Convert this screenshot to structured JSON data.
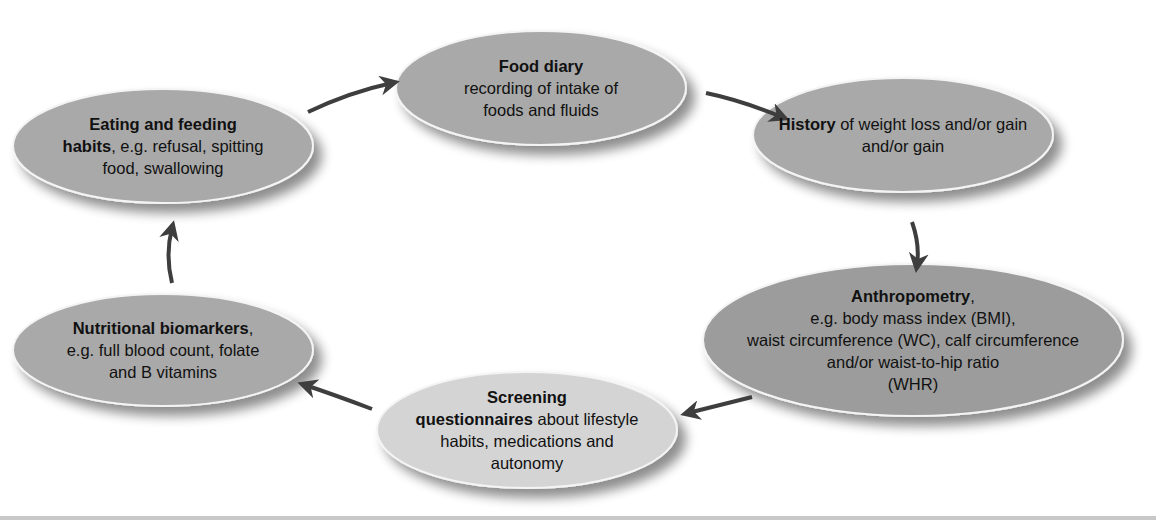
{
  "diagram": {
    "type": "cycle",
    "colors": {
      "node_default": "#a8a8a8",
      "node_dark": "#9b9b9b",
      "node_light": "#d3d3d3",
      "arrow": "#3e3e3e",
      "rule": "#c8c8c8"
    },
    "nodes": [
      {
        "id": "food-diary",
        "bold": "Food diary",
        "rest": "recording of intake of foods and fluids",
        "lines": [
          "",
          "recording of intake of",
          "foods and fluids"
        ]
      },
      {
        "id": "history",
        "bold": "History",
        "rest": " of weight loss and/or gain",
        "lines": [
          "",
          "and/or gain"
        ]
      },
      {
        "id": "anthropometry",
        "bold": "Anthropometry",
        "rest": ",",
        "lines": [
          "e.g. body mass index (BMI),",
          "waist circumference (WC), calf circumference",
          "and/or waist-to-hip ratio",
          "(WHR)"
        ]
      },
      {
        "id": "screening",
        "bold": "Screening",
        "bold2": "questionnaires",
        "rest": " about lifestyle",
        "lines": [
          "habits, medications and",
          "autonomy"
        ]
      },
      {
        "id": "nutritional-biomarkers",
        "bold": "Nutritional biomarkers",
        "rest": ",",
        "lines": [
          "e.g. full blood count, folate",
          "and B vitamins"
        ]
      },
      {
        "id": "eating-habits",
        "bold": "Eating and feeding",
        "bold2": "habits",
        "rest": ", e.g. refusal, spitting",
        "lines": [
          "food, swallowing"
        ]
      }
    ],
    "edges": [
      {
        "from": "food-diary",
        "to": "history"
      },
      {
        "from": "history",
        "to": "anthropometry"
      },
      {
        "from": "anthropometry",
        "to": "screening"
      },
      {
        "from": "screening",
        "to": "nutritional-biomarkers"
      },
      {
        "from": "nutritional-biomarkers",
        "to": "eating-habits"
      },
      {
        "from": "eating-habits",
        "to": "food-diary"
      }
    ]
  }
}
